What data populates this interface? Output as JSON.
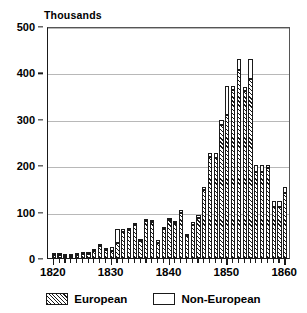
{
  "chart_data": {
    "type": "bar",
    "title": "Thousands",
    "subtitle": "",
    "xlabel": "",
    "ylabel": "Thousands",
    "stacked": true,
    "grid": true,
    "legend_position": "bottom",
    "xlim": [
      1819,
      1861
    ],
    "ylim": [
      0,
      500
    ],
    "ytick_labels": [
      "0",
      "100",
      "200",
      "300",
      "400",
      "500"
    ],
    "ytick_values": [
      0,
      100,
      200,
      300,
      400,
      500
    ],
    "xtick_labels": [
      "1820",
      "1830",
      "1840",
      "1850",
      "1860"
    ],
    "xtick_values": [
      1820,
      1830,
      1840,
      1850,
      1860
    ],
    "categories": [
      "1820",
      "1821",
      "1822",
      "1823",
      "1824",
      "1825",
      "1826",
      "1827",
      "1828",
      "1829",
      "1830",
      "1831",
      "1832",
      "1833",
      "1834",
      "1835",
      "1836",
      "1837",
      "1838",
      "1839",
      "1840",
      "1841",
      "1842",
      "1843",
      "1844",
      "1845",
      "1846",
      "1847",
      "1848",
      "1849",
      "1850",
      "1851",
      "1852",
      "1853",
      "1854",
      "1855",
      "1856",
      "1857",
      "1858",
      "1859",
      "1860"
    ],
    "series": [
      {
        "name": "European",
        "values": [
          7,
          6,
          4,
          5,
          7,
          8,
          9,
          16,
          25,
          17,
          15,
          33,
          57,
          60,
          71,
          37,
          80,
          77,
          33,
          63,
          81,
          76,
          96,
          47,
          71,
          87,
          146,
          218,
          216,
          286,
          309,
          363,
          406,
          359,
          386,
          186,
          186,
          195,
          111,
          111,
          141
        ]
      },
      {
        "name": "Non-European",
        "values": [
          1,
          1,
          2,
          1,
          1,
          2,
          2,
          2,
          2,
          4,
          8,
          29,
          6,
          4,
          4,
          3,
          3,
          2,
          5,
          2,
          3,
          4,
          8,
          4,
          7,
          6,
          8,
          9,
          10,
          11,
          61,
          8,
          22,
          9,
          42,
          14,
          15,
          5,
          12,
          12,
          12
        ]
      }
    ]
  },
  "legend": {
    "entries": [
      {
        "label": "European",
        "pattern": "hatched"
      },
      {
        "label": "Non-European",
        "pattern": "plain"
      }
    ]
  },
  "colors": {
    "axis": "#1a1a1a",
    "gridline": "#b8b8b8",
    "bar_fill": "#ffffff",
    "hatch": "#1a1a1a",
    "background": "#ffffff"
  }
}
